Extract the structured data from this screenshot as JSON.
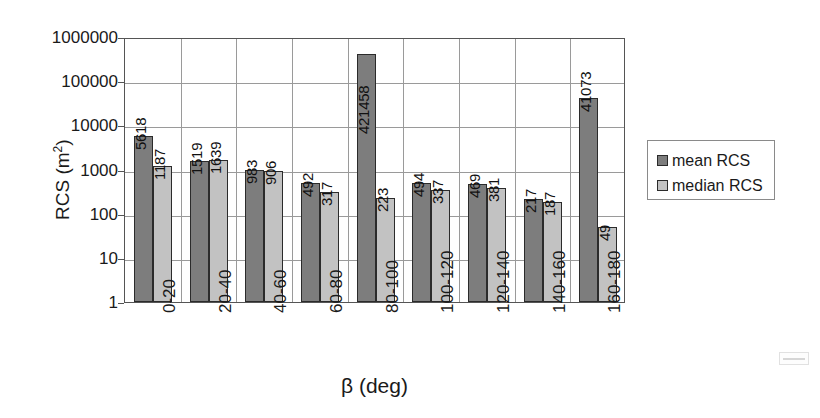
{
  "chart_data": {
    "type": "bar",
    "title": "",
    "xlabel": "β (deg)",
    "ylabel": "RCS (m²)",
    "ylabel_base": "RCS (m",
    "ylabel_sup": "2",
    "ylabel_close": ")",
    "yscale": "log",
    "ylim": [
      1,
      1000000
    ],
    "yticks": [
      "1000000",
      "100000",
      "10000",
      "1000",
      "100",
      "10",
      "1"
    ],
    "ytick_values": [
      1000000,
      100000,
      10000,
      1000,
      100,
      10,
      1
    ],
    "grid": "horizontal-major-and-vertical-category",
    "legend_position": "right",
    "categories": [
      "0-20",
      "20-40",
      "40-60",
      "60-80",
      "80-100",
      "100-120",
      "120-140",
      "140-160",
      "160-180"
    ],
    "series": [
      {
        "name": "mean RCS",
        "color": "#7d7d7d",
        "values": [
          5618,
          1519,
          983,
          492,
          421458,
          494,
          469,
          217,
          41073
        ],
        "labels": [
          "5618",
          "1519",
          "983",
          "492",
          "421458",
          "494",
          "469",
          "217",
          "41073"
        ]
      },
      {
        "name": "median RCS",
        "color": "#c2c2c2",
        "values": [
          1187,
          1639,
          906,
          317,
          223,
          337,
          381,
          187,
          49
        ],
        "labels": [
          "1187",
          "1639",
          "906",
          "317",
          "223",
          "337",
          "381",
          "187",
          "49"
        ]
      }
    ]
  },
  "legend": {
    "items": [
      {
        "label": "mean RCS",
        "swatch": "mean"
      },
      {
        "label": "median RCS",
        "swatch": "median"
      }
    ]
  },
  "artifact": {
    "label": ""
  }
}
